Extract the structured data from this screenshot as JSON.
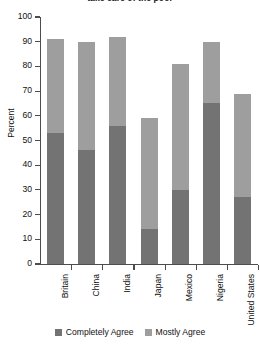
{
  "chart_data": {
    "type": "bar",
    "title": "take care of the poor",
    "xlabel": "",
    "ylabel": "Percent",
    "ylim": [
      0,
      100
    ],
    "ytick_step": 10,
    "yticks": [
      0,
      10,
      20,
      30,
      40,
      50,
      60,
      70,
      80,
      90,
      100
    ],
    "ytick_labels": [
      "0",
      "10",
      "20",
      "30",
      "40",
      "50",
      "60",
      "70",
      "80",
      "90",
      "100"
    ],
    "grid": false,
    "stacked": true,
    "legend_position": "bottom",
    "categories": [
      "Britain",
      "China",
      "India",
      "Japan",
      "Mexico",
      "Nigeria",
      "United States"
    ],
    "series": [
      {
        "name": "Completely Agree",
        "color": "#737373",
        "values": [
          53,
          46,
          56,
          14,
          30,
          65,
          27
        ]
      },
      {
        "name": "Mostly Agree",
        "color": "#9e9e9e",
        "values": [
          38,
          44,
          36,
          45,
          51,
          25,
          42
        ]
      }
    ],
    "totals": [
      91,
      90,
      92,
      59,
      81,
      90,
      69
    ]
  },
  "legend": {
    "items": [
      {
        "label": "Completely Agree",
        "color": "#737373"
      },
      {
        "label": "Mostly Agree",
        "color": "#9e9e9e"
      }
    ]
  }
}
